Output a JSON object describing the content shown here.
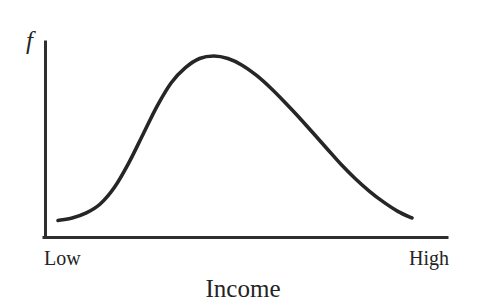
{
  "figure": {
    "background_color": "#ffffff",
    "ink_color": "#262626",
    "axis_color": "#2e2e2e"
  },
  "chart_data": {
    "type": "line",
    "title": "",
    "subtitle": "",
    "xlabel": "Income",
    "ylabel": "f",
    "ylabel_style": "italic",
    "grid": false,
    "legend": null,
    "legend_position": "none",
    "axis_style": "L-shaped spine, no tick marks, no numeric scale",
    "xlim": [
      0,
      1
    ],
    "ylim": [
      0,
      1
    ],
    "x_tick_labels": [
      "Low",
      "High"
    ],
    "x_tick_positions": [
      0,
      1
    ],
    "y_tick_labels": [],
    "annotations": [],
    "series": [
      {
        "name": "Income density f",
        "color": "#262626",
        "x": [
          0.0,
          0.04,
          0.08,
          0.12,
          0.16,
          0.2,
          0.24,
          0.28,
          0.32,
          0.36,
          0.4,
          0.44,
          0.48,
          0.52,
          0.56,
          0.6,
          0.64,
          0.68,
          0.72,
          0.76,
          0.8,
          0.84,
          0.88,
          0.92,
          0.96,
          1.0
        ],
        "y": [
          0.015,
          0.03,
          0.06,
          0.115,
          0.215,
          0.36,
          0.53,
          0.7,
          0.84,
          0.93,
          0.985,
          1.0,
          0.985,
          0.945,
          0.885,
          0.81,
          0.725,
          0.635,
          0.54,
          0.445,
          0.35,
          0.265,
          0.19,
          0.125,
          0.07,
          0.03
        ]
      }
    ]
  },
  "labels": {
    "y_axis_symbol": "f",
    "x_low": "Low",
    "x_high": "High",
    "x_axis_title": "Income"
  }
}
